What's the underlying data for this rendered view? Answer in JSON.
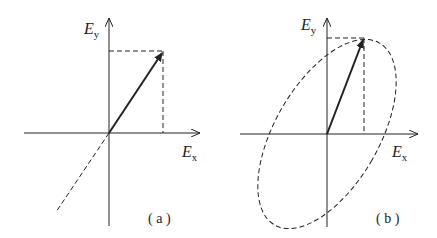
{
  "panels": [
    {
      "id": "a",
      "caption": "( a )",
      "y_label": "E",
      "y_sub": "y",
      "x_label": "E",
      "x_sub": "x",
      "description": "linear polarization"
    },
    {
      "id": "b",
      "caption": "( b )",
      "y_label": "E",
      "y_sub": "y",
      "x_label": "E",
      "x_sub": "x",
      "description": "elliptical polarization"
    }
  ],
  "colors": {
    "stroke": "#222222",
    "background": "#ffffff"
  }
}
